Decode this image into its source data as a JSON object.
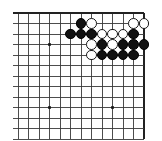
{
  "board": {
    "type": "go-board-diagram",
    "title": "Go board corner position",
    "geometry": {
      "cols": 13,
      "rows": 12,
      "spacing": 10.5,
      "origin_x": 18,
      "origin_y": 13,
      "edge_top_row": 1,
      "edge_right_col": 13,
      "stone_radius": 5.4
    },
    "colors": {
      "line": "#3a3a3a",
      "edge_line": "#222222",
      "black_stone": "#111111",
      "white_stone": "#ffffff",
      "white_stone_border": "#1a1a1a",
      "background": "#ffffff",
      "hoshi": "#1a1a1a"
    },
    "hoshi_points": [
      {
        "col": 4,
        "row": 4
      },
      {
        "col": 4,
        "row": 10
      },
      {
        "col": 10,
        "row": 10
      }
    ],
    "stones": [
      {
        "color": "black",
        "col": 7,
        "row": 2
      },
      {
        "color": "white",
        "col": 8,
        "row": 2
      },
      {
        "color": "white",
        "col": 12,
        "row": 2
      },
      {
        "color": "white",
        "col": 13,
        "row": 2
      },
      {
        "color": "black",
        "col": 6,
        "row": 3
      },
      {
        "color": "black",
        "col": 7,
        "row": 3
      },
      {
        "color": "black",
        "col": 8,
        "row": 3
      },
      {
        "color": "white",
        "col": 9,
        "row": 3
      },
      {
        "color": "white",
        "col": 10,
        "row": 3
      },
      {
        "color": "white",
        "col": 11,
        "row": 3
      },
      {
        "color": "black",
        "col": 12,
        "row": 3
      },
      {
        "color": "white",
        "col": 8,
        "row": 4
      },
      {
        "color": "black",
        "col": 9,
        "row": 4
      },
      {
        "color": "white",
        "col": 10,
        "row": 4
      },
      {
        "color": "black",
        "col": 11,
        "row": 4
      },
      {
        "color": "black",
        "col": 12,
        "row": 4
      },
      {
        "color": "black",
        "col": 13,
        "row": 4
      },
      {
        "color": "white",
        "col": 8,
        "row": 5
      },
      {
        "color": "black",
        "col": 9,
        "row": 5
      },
      {
        "color": "black",
        "col": 10,
        "row": 5
      },
      {
        "color": "black",
        "col": 11,
        "row": 5
      },
      {
        "color": "black",
        "col": 12,
        "row": 5
      }
    ],
    "counts": {
      "black_stones": 14,
      "white_stones": 9,
      "total_stones": 23
    }
  }
}
